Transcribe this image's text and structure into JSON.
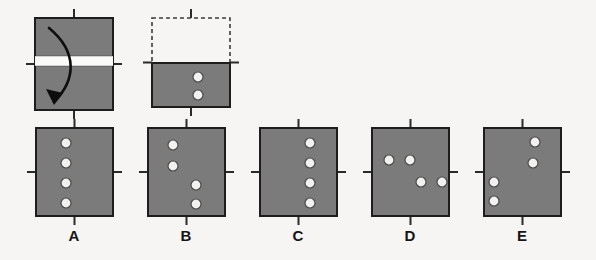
{
  "page": {
    "kind": "paper-folding-hole-punch-item",
    "background_color": "#f6f5f3",
    "paper_fill_color": "#7b7b7b",
    "paper_stroke_color": "#1d1d1d",
    "hole_fill_color": "#f2f1ef",
    "hole_stroke_color": "#4a4a4a",
    "tick_color": "#2a2a2a",
    "arrow_color": "#0d0d0d",
    "fold_band_color": "#fbfbfa",
    "dashed_stroke_color": "#3b3b3b"
  },
  "prompt": {
    "fold_step": {
      "name": "fold-step-square",
      "description": "square sheet with horizontal fold crease across the middle and a curved arrow showing the top half folding down",
      "square": {
        "x": 35,
        "y": 18,
        "w": 78,
        "h": 92
      },
      "crease_band": {
        "x": 35,
        "y": 56,
        "w": 78,
        "h": 10
      },
      "ticks": [
        {
          "name": "tick-top",
          "side": "top"
        },
        {
          "name": "tick-bottom",
          "side": "bottom"
        },
        {
          "name": "tick-left",
          "side": "left"
        },
        {
          "name": "tick-right",
          "side": "right"
        }
      ],
      "arrow": {
        "name": "fold-arrow",
        "path": "M 49 28 C 78 52, 76 80, 54 102",
        "head_points": "54,105 46,89 63,93"
      }
    },
    "punch_step": {
      "name": "punch-step-figure",
      "description": "folded sheet: dashed outline of the folded-away top half, solid lower half with two punched holes",
      "dashed_rect": {
        "x": 152,
        "y": 18,
        "w": 78,
        "h": 45
      },
      "solid_rect": {
        "x": 152,
        "y": 63,
        "w": 78,
        "h": 44
      },
      "holes": [
        {
          "cx": 198,
          "cy": 77,
          "r": 5
        },
        {
          "cx": 198,
          "cy": 95,
          "r": 5
        }
      ],
      "ticks": [
        {
          "name": "tick-top",
          "side": "top"
        },
        {
          "name": "tick-bottom",
          "side": "bottom"
        },
        {
          "name": "tick-left",
          "side": "left"
        },
        {
          "name": "tick-right",
          "side": "right"
        }
      ]
    }
  },
  "answer_options": [
    {
      "id": "A",
      "label": "A",
      "name": "option-a",
      "square": {
        "x": 36,
        "y": 128,
        "w": 77,
        "h": 88
      },
      "label_pos": {
        "x": 74,
        "y": 241
      },
      "holes": [
        {
          "cx": 66,
          "cy": 143,
          "r": 5
        },
        {
          "cx": 66,
          "cy": 163,
          "r": 5
        },
        {
          "cx": 66,
          "cy": 183,
          "r": 5
        },
        {
          "cx": 66,
          "cy": 203,
          "r": 5
        }
      ],
      "description": "four holes in a single vertical column left of center"
    },
    {
      "id": "B",
      "label": "B",
      "name": "option-b",
      "square": {
        "x": 148,
        "y": 128,
        "w": 77,
        "h": 88
      },
      "label_pos": {
        "x": 186,
        "y": 241
      },
      "holes": [
        {
          "cx": 173,
          "cy": 145,
          "r": 5
        },
        {
          "cx": 173,
          "cy": 166,
          "r": 5
        },
        {
          "cx": 196,
          "cy": 185,
          "r": 5
        },
        {
          "cx": 196,
          "cy": 204,
          "r": 5
        }
      ],
      "description": "two holes upper-left stacked, two holes lower-center stacked"
    },
    {
      "id": "C",
      "label": "C",
      "name": "option-c",
      "square": {
        "x": 260,
        "y": 128,
        "w": 77,
        "h": 88
      },
      "label_pos": {
        "x": 298,
        "y": 241
      },
      "holes": [
        {
          "cx": 310,
          "cy": 143,
          "r": 5
        },
        {
          "cx": 310,
          "cy": 163,
          "r": 5
        },
        {
          "cx": 310,
          "cy": 183,
          "r": 5
        },
        {
          "cx": 310,
          "cy": 203,
          "r": 5
        }
      ],
      "description": "four holes in a single vertical column right of center"
    },
    {
      "id": "D",
      "label": "D",
      "name": "option-d",
      "square": {
        "x": 372,
        "y": 128,
        "w": 77,
        "h": 88
      },
      "label_pos": {
        "x": 410,
        "y": 241
      },
      "holes": [
        {
          "cx": 389,
          "cy": 160,
          "r": 5
        },
        {
          "cx": 410,
          "cy": 160,
          "r": 5
        },
        {
          "cx": 421,
          "cy": 182,
          "r": 5
        },
        {
          "cx": 442,
          "cy": 182,
          "r": 5
        }
      ],
      "description": "two holes in an upper-left horizontal pair, two holes in a lower-right horizontal pair"
    },
    {
      "id": "E",
      "label": "E",
      "name": "option-e",
      "square": {
        "x": 484,
        "y": 128,
        "w": 77,
        "h": 88
      },
      "label_pos": {
        "x": 522,
        "y": 241
      },
      "holes": [
        {
          "cx": 535,
          "cy": 142,
          "r": 5
        },
        {
          "cx": 533,
          "cy": 163,
          "r": 5
        },
        {
          "cx": 494,
          "cy": 182,
          "r": 5
        },
        {
          "cx": 494,
          "cy": 201,
          "r": 5
        }
      ],
      "description": "two holes upper-right stacked, two holes lower-left stacked"
    }
  ],
  "tick_geometry": {
    "length": 9,
    "stroke_width": 2
  }
}
